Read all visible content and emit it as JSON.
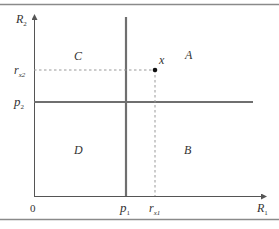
{
  "diagram": {
    "axes": {
      "x_label": "R",
      "x_label_sub": "1",
      "y_label": "R",
      "y_label_sub": "2",
      "origin_label": "0"
    },
    "thresholds": {
      "p1_label": "p",
      "p1_sub": "1",
      "p2_label": "p",
      "p2_sub": "2"
    },
    "point": {
      "label": "x",
      "rx1_label": "r",
      "rx1_sub": "x1",
      "rx2_label": "r",
      "rx2_sub": "x2"
    },
    "regions": {
      "A": "A",
      "B": "B",
      "C": "C",
      "D": "D"
    },
    "colors": {
      "frame": "#8a8a8a",
      "axis": "#555555",
      "threshold": "#777777",
      "dashed": "#999999",
      "text": "#333333"
    }
  }
}
